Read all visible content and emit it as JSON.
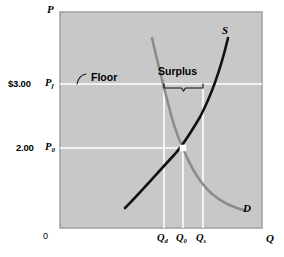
{
  "chart_data": {
    "type": "line",
    "title": "",
    "subtitle": "",
    "xlabel": "Q",
    "ylabel": "P",
    "grid": true,
    "legend_position": "inline-curve-labels",
    "origin_label": "0",
    "axis": {
      "y_letter": "P",
      "x_letter": "Q"
    },
    "price_ticks": [
      {
        "id": "floor",
        "value_label": "$3.00",
        "symbol": "P",
        "subscript": "f",
        "y_px": 84
      },
      {
        "id": "equilibrium",
        "value_label": "2.00",
        "symbol": "P",
        "subscript": "0",
        "y_px": 148
      }
    ],
    "quantity_ticks": [
      {
        "id": "qd",
        "symbol": "Q",
        "subscript": "d",
        "x_px": 164
      },
      {
        "id": "q0",
        "symbol": "Q",
        "subscript": "0",
        "x_px": 183
      },
      {
        "id": "qs",
        "symbol": "Q",
        "subscript": "s",
        "x_px": 203
      }
    ],
    "series": [
      {
        "name": "S",
        "role": "supply",
        "label": "S",
        "color": "#111111",
        "points": [
          [
            125,
            208
          ],
          [
            141,
            192
          ],
          [
            158,
            172
          ],
          [
            172,
            157
          ],
          [
            183,
            148
          ],
          [
            196,
            129
          ],
          [
            208,
            106
          ],
          [
            217,
            83
          ],
          [
            224,
            58
          ],
          [
            228,
            38
          ]
        ]
      },
      {
        "name": "D",
        "role": "demand",
        "label": "D",
        "color": "#8c8c8c",
        "points": [
          [
            152,
            38
          ],
          [
            158,
            60
          ],
          [
            164,
            84
          ],
          [
            171,
            112
          ],
          [
            183,
            148
          ],
          [
            195,
            173
          ],
          [
            208,
            190
          ],
          [
            222,
            201
          ],
          [
            238,
            208
          ],
          [
            247,
            211
          ]
        ]
      }
    ],
    "equilibrium_marker": {
      "x_px": 183,
      "y_px": 148,
      "style": "white-square"
    },
    "annotations": [
      {
        "id": "floor-callout",
        "text": "Floor",
        "x_px": 88,
        "y_px": 78
      },
      {
        "id": "surplus-callout",
        "text": "Surplus",
        "x_px": 160,
        "y_px": 68
      }
    ],
    "surplus_bracket": {
      "from_x_px": 164,
      "to_x_px": 203,
      "y_px": 88
    },
    "xlim_px": [
      60,
      262
    ],
    "ylim_px": [
      12,
      228
    ],
    "colors": {
      "plot_fill": "#c8c8c8",
      "plot_border": "#9a9a9a",
      "gridline": "#ffffff",
      "supply": "#111111",
      "demand": "#8c8c8c",
      "text": "#000000",
      "page_background": "#ffffff"
    }
  }
}
